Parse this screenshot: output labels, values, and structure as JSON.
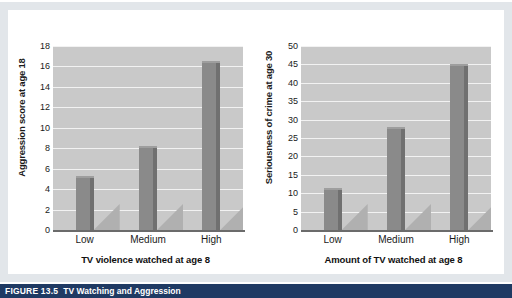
{
  "figure": {
    "caption_number": "FIGURE 13.5",
    "caption_title": "TV Watching and Aggression",
    "background_color": "#e2e6ea",
    "caption_bar_color": "#1f3a63",
    "plot_background_color": "#c9c9c9",
    "bar_color": "#8a8a8a",
    "gridline_color": "#f2f2f2"
  },
  "chart_data": [
    {
      "type": "bar",
      "title": "",
      "xlabel": "TV violence watched at age 8",
      "ylabel": "Aggression score at age 18",
      "categories": [
        "Low",
        "Medium",
        "High"
      ],
      "values": [
        5.3,
        8.2,
        16.5
      ],
      "ylim": [
        0,
        18
      ],
      "yticks": [
        0,
        2,
        4,
        6,
        8,
        10,
        12,
        14,
        16,
        18
      ],
      "ytick_labels": [
        "0",
        "2",
        "4",
        "6",
        "8",
        "10",
        "12",
        "14",
        "16",
        "18"
      ],
      "grid": true,
      "legend": "none"
    },
    {
      "type": "bar",
      "title": "",
      "xlabel": "Amount of TV watched at age 8",
      "ylabel": "Seriousness of crime at age 30",
      "categories": [
        "Low",
        "Medium",
        "High"
      ],
      "values": [
        11.5,
        28,
        45
      ],
      "ylim": [
        0,
        50
      ],
      "yticks": [
        0,
        5,
        10,
        15,
        20,
        25,
        30,
        35,
        40,
        45,
        50
      ],
      "ytick_labels": [
        "0",
        "5",
        "10",
        "15",
        "20",
        "25",
        "30",
        "35",
        "40",
        "45",
        "50"
      ],
      "grid": true,
      "legend": "none"
    }
  ]
}
